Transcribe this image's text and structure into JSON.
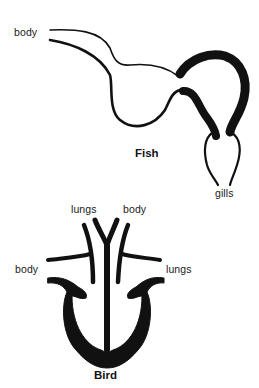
{
  "fish": {
    "title": "Fish",
    "labels": {
      "body": "body",
      "gills": "gills"
    }
  },
  "bird": {
    "title": "Bird",
    "labels": {
      "lungs_top": "lungs",
      "body_top": "body",
      "body_left": "body",
      "lungs_right": "lungs"
    }
  },
  "colors": {
    "ink": "#111111",
    "background": "#ffffff"
  }
}
